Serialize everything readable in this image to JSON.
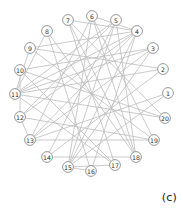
{
  "figure": {
    "caption": "(c)",
    "width": 183,
    "height": 209,
    "background_color": "#ffffff"
  },
  "chart_data": {
    "type": "diagram",
    "subtype": "circular-node-link-graph",
    "title": "",
    "xlabel": "",
    "ylabel": "",
    "caption": "(c)",
    "layout": "circular",
    "node_count": 20,
    "edge_count": 45,
    "colors": {
      "edge": "#bdbdbd",
      "node_stroke": "#8c8c8c",
      "node_fill": "#ffffff",
      "label": "#2b2b2b",
      "caption": "#1a1a1a"
    },
    "nodes": [
      {
        "id": 1,
        "label": "1",
        "x": 168,
        "y": 93
      },
      {
        "id": 2,
        "label": "2",
        "x": 163,
        "y": 69
      },
      {
        "id": 3,
        "label": "3",
        "x": 153,
        "y": 48
      },
      {
        "id": 4,
        "label": "4",
        "x": 137,
        "y": 31
      },
      {
        "id": 5,
        "label": "5",
        "x": 116,
        "y": 20
      },
      {
        "id": 6,
        "label": "6",
        "x": 92,
        "y": 16
      },
      {
        "id": 7,
        "label": "7",
        "x": 68,
        "y": 20
      },
      {
        "id": 8,
        "label": "8",
        "x": 47,
        "y": 31
      },
      {
        "id": 9,
        "label": "9",
        "x": 30,
        "y": 48
      },
      {
        "id": 10,
        "label": "10",
        "x": 20,
        "y": 70
      },
      {
        "id": 11,
        "label": "11",
        "x": 15,
        "y": 94
      },
      {
        "id": 12,
        "label": "12",
        "x": 20,
        "y": 117
      },
      {
        "id": 13,
        "label": "13",
        "x": 30,
        "y": 140
      },
      {
        "id": 14,
        "label": "14",
        "x": 47,
        "y": 157
      },
      {
        "id": 15,
        "label": "15",
        "x": 68,
        "y": 167
      },
      {
        "id": 16,
        "label": "16",
        "x": 91,
        "y": 171
      },
      {
        "id": 17,
        "label": "17",
        "x": 115,
        "y": 165
      },
      {
        "id": 18,
        "label": "18",
        "x": 136,
        "y": 157
      },
      {
        "id": 19,
        "label": "19",
        "x": 154,
        "y": 140
      },
      {
        "id": 20,
        "label": "20",
        "x": 165,
        "y": 118
      }
    ],
    "edges": [
      {
        "source": 1,
        "target": 13
      },
      {
        "source": 1,
        "target": 15
      },
      {
        "source": 2,
        "target": 9
      },
      {
        "source": 2,
        "target": 11
      },
      {
        "source": 2,
        "target": 14
      },
      {
        "source": 3,
        "target": 10
      },
      {
        "source": 3,
        "target": 11
      },
      {
        "source": 3,
        "target": 13
      },
      {
        "source": 3,
        "target": 15
      },
      {
        "source": 4,
        "target": 9
      },
      {
        "source": 4,
        "target": 11
      },
      {
        "source": 4,
        "target": 12
      },
      {
        "source": 4,
        "target": 13
      },
      {
        "source": 4,
        "target": 15
      },
      {
        "source": 4,
        "target": 16
      },
      {
        "source": 5,
        "target": 11
      },
      {
        "source": 5,
        "target": 12
      },
      {
        "source": 5,
        "target": 14
      },
      {
        "source": 5,
        "target": 15
      },
      {
        "source": 5,
        "target": 18
      },
      {
        "source": 6,
        "target": 4
      },
      {
        "source": 6,
        "target": 13
      },
      {
        "source": 6,
        "target": 15
      },
      {
        "source": 6,
        "target": 18
      },
      {
        "source": 6,
        "target": 19
      },
      {
        "source": 7,
        "target": 4
      },
      {
        "source": 7,
        "target": 17
      },
      {
        "source": 7,
        "target": 18
      },
      {
        "source": 7,
        "target": 20
      },
      {
        "source": 8,
        "target": 11
      },
      {
        "source": 8,
        "target": 16
      },
      {
        "source": 8,
        "target": 18
      },
      {
        "source": 9,
        "target": 11
      },
      {
        "source": 9,
        "target": 19
      },
      {
        "source": 10,
        "target": 12
      },
      {
        "source": 10,
        "target": 17
      },
      {
        "source": 10,
        "target": 20
      },
      {
        "source": 11,
        "target": 17
      },
      {
        "source": 11,
        "target": 20
      },
      {
        "source": 12,
        "target": 13
      },
      {
        "source": 12,
        "target": 19
      },
      {
        "source": 13,
        "target": 19
      },
      {
        "source": 14,
        "target": 18
      },
      {
        "source": 15,
        "target": 16
      },
      {
        "source": 15,
        "target": 17
      }
    ]
  }
}
